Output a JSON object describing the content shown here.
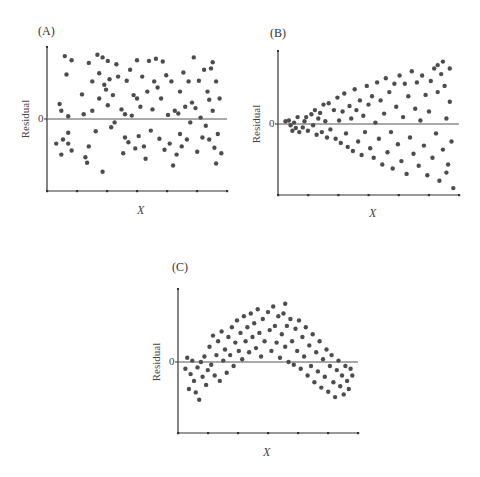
{
  "chart_data": [
    {
      "type": "scatter",
      "panel_label": "(A)",
      "title": "",
      "xlabel": "X",
      "ylabel": "Residual",
      "y_tick_labels": [
        "0"
      ],
      "grid": false,
      "reference_line": 0,
      "pattern": "random scatter, constant spread",
      "xlim": [
        0,
        1
      ],
      "ylim": [
        -1,
        1
      ],
      "points": [
        [
          0.03,
          -0.36
        ],
        [
          0.05,
          0.22
        ],
        [
          0.06,
          0.12
        ],
        [
          0.06,
          -0.52
        ],
        [
          0.07,
          -0.3
        ],
        [
          0.08,
          0.92
        ],
        [
          0.09,
          0.65
        ],
        [
          0.1,
          0.04
        ],
        [
          0.1,
          -0.2
        ],
        [
          0.1,
          -0.36
        ],
        [
          0.12,
          -0.46
        ],
        [
          0.12,
          0.86
        ],
        [
          0.18,
          0.36
        ],
        [
          0.19,
          0.07
        ],
        [
          0.2,
          -0.56
        ],
        [
          0.21,
          -0.64
        ],
        [
          0.22,
          -0.4
        ],
        [
          0.22,
          0.82
        ],
        [
          0.24,
          0.12
        ],
        [
          0.24,
          0.55
        ],
        [
          0.26,
          -0.18
        ],
        [
          0.27,
          0.94
        ],
        [
          0.28,
          0.67
        ],
        [
          0.28,
          0.3
        ],
        [
          0.3,
          0.9
        ],
        [
          0.3,
          -0.77
        ],
        [
          0.31,
          0.5
        ],
        [
          0.32,
          0.43
        ],
        [
          0.33,
          0.85
        ],
        [
          0.33,
          0.2
        ],
        [
          0.34,
          0.58
        ],
        [
          0.35,
          -0.12
        ],
        [
          0.36,
          0.35
        ],
        [
          0.37,
          -0.05
        ],
        [
          0.38,
          0.8
        ],
        [
          0.39,
          0.62
        ],
        [
          0.41,
          0.14
        ],
        [
          0.42,
          -0.5
        ],
        [
          0.43,
          0.07
        ],
        [
          0.43,
          -0.27
        ],
        [
          0.44,
          0.56
        ],
        [
          0.45,
          -0.34
        ],
        [
          0.46,
          0.72
        ],
        [
          0.47,
          0.05
        ],
        [
          0.48,
          0.35
        ],
        [
          0.49,
          -0.43
        ],
        [
          0.5,
          0.86
        ],
        [
          0.5,
          0.3
        ],
        [
          0.51,
          -0.25
        ],
        [
          0.52,
          0.18
        ],
        [
          0.53,
          0.62
        ],
        [
          0.54,
          -0.4
        ],
        [
          0.55,
          -0.58
        ],
        [
          0.56,
          0.4
        ],
        [
          0.57,
          0.85
        ],
        [
          0.58,
          -0.17
        ],
        [
          0.59,
          0.14
        ],
        [
          0.6,
          0.55
        ],
        [
          0.61,
          0.88
        ],
        [
          0.62,
          0.46
        ],
        [
          0.63,
          -0.29
        ],
        [
          0.64,
          0.3
        ],
        [
          0.65,
          0.84
        ],
        [
          0.66,
          -0.45
        ],
        [
          0.67,
          0.64
        ],
        [
          0.68,
          0.06
        ],
        [
          0.69,
          -0.36
        ],
        [
          0.7,
          0.55
        ],
        [
          0.71,
          -0.68
        ],
        [
          0.72,
          0.12
        ],
        [
          0.73,
          -0.52
        ],
        [
          0.74,
          0.08
        ],
        [
          0.75,
          0.4
        ],
        [
          0.75,
          -0.22
        ],
        [
          0.76,
          -0.4
        ],
        [
          0.77,
          0.68
        ],
        [
          0.78,
          0.18
        ],
        [
          0.79,
          -0.3
        ],
        [
          0.8,
          0.55
        ],
        [
          0.81,
          -0.05
        ],
        [
          0.82,
          0.24
        ],
        [
          0.83,
          0.9
        ],
        [
          0.84,
          0.16
        ],
        [
          0.85,
          -0.48
        ],
        [
          0.86,
          0.56
        ],
        [
          0.87,
          0.02
        ],
        [
          0.88,
          -0.27
        ],
        [
          0.89,
          0.72
        ],
        [
          0.9,
          -0.1
        ],
        [
          0.91,
          0.4
        ],
        [
          0.92,
          -0.3
        ],
        [
          0.93,
          0.74
        ],
        [
          0.94,
          0.12
        ],
        [
          0.95,
          -0.42
        ],
        [
          0.96,
          0.55
        ],
        [
          0.97,
          -0.22
        ],
        [
          0.98,
          0.3
        ],
        [
          0.99,
          -0.5
        ],
        [
          0.96,
          -0.65
        ],
        [
          0.94,
          0.83
        ],
        [
          0.92,
          0.28
        ]
      ]
    },
    {
      "type": "scatter",
      "panel_label": "(B)",
      "title": "",
      "xlabel": "X",
      "ylabel": "Residual",
      "y_tick_labels": [
        "0"
      ],
      "grid": false,
      "reference_line": 0,
      "pattern": "funnel shape, variance increasing with X",
      "xlim": [
        0,
        1
      ],
      "ylim": [
        -1,
        1
      ],
      "points": [
        [
          0.02,
          0.04
        ],
        [
          0.04,
          0.05
        ],
        [
          0.05,
          -0.02
        ],
        [
          0.06,
          -0.1
        ],
        [
          0.07,
          0.02
        ],
        [
          0.08,
          -0.06
        ],
        [
          0.09,
          0.1
        ],
        [
          0.1,
          -0.12
        ],
        [
          0.12,
          -0.05
        ],
        [
          0.13,
          0.04
        ],
        [
          0.14,
          0.1
        ],
        [
          0.15,
          -0.1
        ],
        [
          0.17,
          0.14
        ],
        [
          0.18,
          -0.02
        ],
        [
          0.19,
          0.2
        ],
        [
          0.2,
          -0.16
        ],
        [
          0.21,
          0.08
        ],
        [
          0.22,
          0.16
        ],
        [
          0.23,
          -0.12
        ],
        [
          0.24,
          0.28
        ],
        [
          0.25,
          0.04
        ],
        [
          0.26,
          -0.2
        ],
        [
          0.27,
          0.3
        ],
        [
          0.28,
          -0.08
        ],
        [
          0.3,
          0.2
        ],
        [
          0.31,
          -0.22
        ],
        [
          0.32,
          0.38
        ],
        [
          0.33,
          0.05
        ],
        [
          0.34,
          -0.28
        ],
        [
          0.35,
          0.18
        ],
        [
          0.36,
          0.44
        ],
        [
          0.37,
          -0.14
        ],
        [
          0.38,
          -0.34
        ],
        [
          0.39,
          0.26
        ],
        [
          0.4,
          0.08
        ],
        [
          0.41,
          -0.4
        ],
        [
          0.42,
          0.5
        ],
        [
          0.43,
          0.2
        ],
        [
          0.44,
          -0.26
        ],
        [
          0.45,
          0.34
        ],
        [
          0.46,
          -0.46
        ],
        [
          0.47,
          0.12
        ],
        [
          0.48,
          -0.12
        ],
        [
          0.49,
          0.55
        ],
        [
          0.5,
          0.28
        ],
        [
          0.51,
          -0.36
        ],
        [
          0.52,
          0.4
        ],
        [
          0.53,
          -0.5
        ],
        [
          0.54,
          0.02
        ],
        [
          0.55,
          0.6
        ],
        [
          0.56,
          -0.22
        ],
        [
          0.57,
          0.34
        ],
        [
          0.58,
          -0.6
        ],
        [
          0.59,
          0.15
        ],
        [
          0.6,
          0.66
        ],
        [
          0.61,
          -0.42
        ],
        [
          0.62,
          0.46
        ],
        [
          0.63,
          -0.12
        ],
        [
          0.64,
          -0.66
        ],
        [
          0.65,
          0.58
        ],
        [
          0.66,
          0.25
        ],
        [
          0.67,
          -0.3
        ],
        [
          0.68,
          0.7
        ],
        [
          0.69,
          -0.55
        ],
        [
          0.7,
          0.1
        ],
        [
          0.71,
          0.58
        ],
        [
          0.72,
          -0.74
        ],
        [
          0.73,
          0.4
        ],
        [
          0.74,
          -0.2
        ],
        [
          0.75,
          0.76
        ],
        [
          0.76,
          -0.44
        ],
        [
          0.77,
          0.22
        ],
        [
          0.78,
          0.6
        ],
        [
          0.79,
          -0.62
        ],
        [
          0.8,
          0.05
        ],
        [
          0.81,
          0.7
        ],
        [
          0.82,
          -0.32
        ],
        [
          0.83,
          0.42
        ],
        [
          0.84,
          -0.76
        ],
        [
          0.85,
          0.18
        ],
        [
          0.86,
          0.62
        ],
        [
          0.87,
          -0.5
        ],
        [
          0.88,
          0.8
        ],
        [
          0.89,
          -0.14
        ],
        [
          0.9,
          0.46
        ],
        [
          0.91,
          -0.84
        ],
        [
          0.92,
          0.72
        ],
        [
          0.93,
          -0.38
        ],
        [
          0.94,
          0.55
        ],
        [
          0.95,
          0.08
        ],
        [
          0.96,
          -0.6
        ],
        [
          0.97,
          0.8
        ],
        [
          0.98,
          -0.26
        ],
        [
          0.99,
          -0.95
        ],
        [
          0.97,
          0.32
        ],
        [
          0.95,
          -0.72
        ],
        [
          0.93,
          0.9
        ],
        [
          0.9,
          0.85
        ]
      ]
    },
    {
      "type": "scatter",
      "panel_label": "(C)",
      "title": "",
      "xlabel": "X",
      "ylabel": "Residual",
      "y_tick_labels": [
        "0"
      ],
      "grid": false,
      "reference_line": 0,
      "pattern": "curved (inverted-U) pattern indicating nonlinearity",
      "xlim": [
        0,
        1
      ],
      "ylim": [
        -1,
        1
      ],
      "points": [
        [
          0.02,
          -0.1
        ],
        [
          0.03,
          0.06
        ],
        [
          0.04,
          -0.4
        ],
        [
          0.05,
          -0.18
        ],
        [
          0.06,
          0.02
        ],
        [
          0.07,
          -0.28
        ],
        [
          0.08,
          -0.45
        ],
        [
          0.09,
          -0.08
        ],
        [
          0.1,
          -0.56
        ],
        [
          0.11,
          0.0
        ],
        [
          0.12,
          -0.22
        ],
        [
          0.13,
          0.08
        ],
        [
          0.14,
          -0.34
        ],
        [
          0.15,
          -0.12
        ],
        [
          0.16,
          0.22
        ],
        [
          0.17,
          -0.04
        ],
        [
          0.18,
          0.38
        ],
        [
          0.19,
          -0.2
        ],
        [
          0.2,
          0.1
        ],
        [
          0.21,
          0.3
        ],
        [
          0.22,
          -0.28
        ],
        [
          0.23,
          0.44
        ],
        [
          0.24,
          0.02
        ],
        [
          0.25,
          0.18
        ],
        [
          0.26,
          -0.16
        ],
        [
          0.27,
          0.36
        ],
        [
          0.28,
          0.1
        ],
        [
          0.29,
          0.5
        ],
        [
          0.3,
          -0.06
        ],
        [
          0.31,
          0.28
        ],
        [
          0.32,
          0.6
        ],
        [
          0.33,
          0.16
        ],
        [
          0.34,
          0.42
        ],
        [
          0.35,
          0.04
        ],
        [
          0.36,
          0.66
        ],
        [
          0.37,
          0.3
        ],
        [
          0.38,
          0.5
        ],
        [
          0.39,
          0.14
        ],
        [
          0.4,
          0.7
        ],
        [
          0.41,
          0.36
        ],
        [
          0.42,
          0.56
        ],
        [
          0.43,
          0.2
        ],
        [
          0.44,
          0.76
        ],
        [
          0.45,
          0.42
        ],
        [
          0.46,
          0.08
        ],
        [
          0.47,
          0.62
        ],
        [
          0.48,
          0.3
        ],
        [
          0.5,
          0.72
        ],
        [
          0.51,
          0.46
        ],
        [
          0.52,
          0.16
        ],
        [
          0.53,
          0.8
        ],
        [
          0.54,
          0.52
        ],
        [
          0.55,
          0.28
        ],
        [
          0.56,
          0.66
        ],
        [
          0.57,
          0.06
        ],
        [
          0.58,
          0.4
        ],
        [
          0.59,
          0.7
        ],
        [
          0.6,
          0.22
        ],
        [
          0.61,
          0.52
        ],
        [
          0.62,
          0.0
        ],
        [
          0.63,
          0.62
        ],
        [
          0.64,
          0.3
        ],
        [
          0.65,
          -0.04
        ],
        [
          0.66,
          0.48
        ],
        [
          0.67,
          0.16
        ],
        [
          0.68,
          0.6
        ],
        [
          0.69,
          -0.1
        ],
        [
          0.7,
          0.36
        ],
        [
          0.71,
          0.08
        ],
        [
          0.72,
          0.5
        ],
        [
          0.73,
          -0.2
        ],
        [
          0.74,
          0.24
        ],
        [
          0.75,
          -0.06
        ],
        [
          0.76,
          0.4
        ],
        [
          0.77,
          -0.3
        ],
        [
          0.78,
          0.14
        ],
        [
          0.79,
          -0.14
        ],
        [
          0.8,
          0.3
        ],
        [
          0.81,
          -0.38
        ],
        [
          0.82,
          0.04
        ],
        [
          0.83,
          -0.22
        ],
        [
          0.84,
          0.18
        ],
        [
          0.85,
          -0.44
        ],
        [
          0.86,
          -0.06
        ],
        [
          0.87,
          0.1
        ],
        [
          0.88,
          -0.3
        ],
        [
          0.89,
          -0.52
        ],
        [
          0.9,
          -0.12
        ],
        [
          0.91,
          0.02
        ],
        [
          0.92,
          -0.36
        ],
        [
          0.93,
          -0.2
        ],
        [
          0.94,
          -0.48
        ],
        [
          0.95,
          -0.06
        ],
        [
          0.96,
          -0.28
        ],
        [
          0.97,
          -0.4
        ],
        [
          0.98,
          -0.1
        ],
        [
          0.99,
          -0.2
        ],
        [
          0.6,
          0.84
        ]
      ]
    }
  ],
  "panels": {
    "a": {
      "label": "(A)",
      "ylabel": "Residual",
      "zero": "0",
      "xlabel": "X"
    },
    "b": {
      "label": "(B)",
      "ylabel": "Residual",
      "zero": "0",
      "xlabel": "X"
    },
    "c": {
      "label": "(C)",
      "ylabel": "Residual",
      "zero": "0",
      "xlabel": "X"
    }
  },
  "colors": {
    "point": "#4d4d4d",
    "axis": "#333333",
    "zero_line": "#555555"
  }
}
